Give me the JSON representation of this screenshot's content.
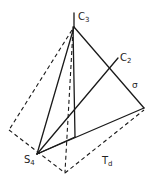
{
  "figure": {
    "labels": {
      "c3": {
        "main": "C",
        "sub": "3"
      },
      "c2": {
        "main": "C",
        "sub": "2"
      },
      "sigma": {
        "main": "σ"
      },
      "s4": {
        "main": "S",
        "sub": "4"
      },
      "td": {
        "main": "T",
        "sub": "d"
      }
    },
    "colors": {
      "line": "#1a1a1a",
      "background": "#ffffff"
    }
  }
}
